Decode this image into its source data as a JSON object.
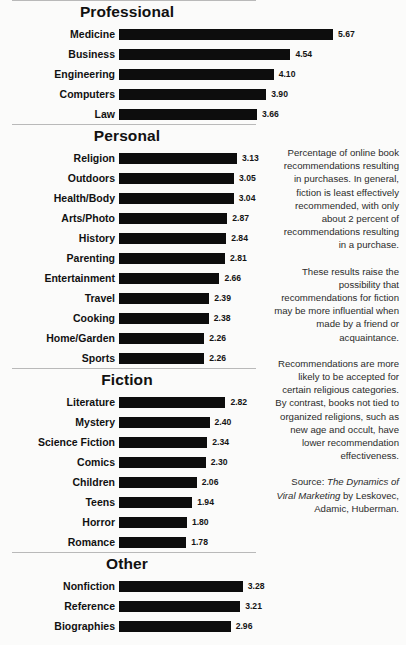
{
  "chart_data": {
    "type": "bar",
    "orientation": "horizontal",
    "title": "",
    "xlabel": "",
    "ylabel": "",
    "xlim": [
      0,
      5.67
    ],
    "grid": false,
    "legend": false,
    "value_format": "2 decimals",
    "sections": [
      {
        "title": "Professional",
        "categories": [
          "Medicine",
          "Business",
          "Engineering",
          "Computers",
          "Law"
        ],
        "values": [
          5.67,
          4.54,
          4.1,
          3.9,
          3.66
        ],
        "labels": [
          "5.67",
          "4.54",
          "4.10",
          "3.90",
          "3.66"
        ]
      },
      {
        "title": "Personal",
        "categories": [
          "Religion",
          "Outdoors",
          "Health/Body",
          "Arts/Photo",
          "History",
          "Parenting",
          "Entertainment",
          "Travel",
          "Cooking",
          "Home/Garden",
          "Sports"
        ],
        "values": [
          3.13,
          3.05,
          3.04,
          2.87,
          2.84,
          2.81,
          2.66,
          2.39,
          2.38,
          2.26,
          2.26
        ],
        "labels": [
          "3.13",
          "3.05",
          "3.04",
          "2.87",
          "2.84",
          "2.81",
          "2.66",
          "2.39",
          "2.38",
          "2.26",
          "2.26"
        ]
      },
      {
        "title": "Fiction",
        "categories": [
          "Literature",
          "Mystery",
          "Science Fiction",
          "Comics",
          "Children",
          "Teens",
          "Horror",
          "Romance"
        ],
        "values": [
          2.82,
          2.4,
          2.34,
          2.3,
          2.06,
          1.94,
          1.8,
          1.78
        ],
        "labels": [
          "2.82",
          "2.40",
          "2.34",
          "2.30",
          "2.06",
          "1.94",
          "1.80",
          "1.78"
        ]
      },
      {
        "title": "Other",
        "categories": [
          "Nonfiction",
          "Reference",
          "Biographies"
        ],
        "values": [
          3.28,
          3.21,
          2.96
        ],
        "labels": [
          "3.28",
          "3.21",
          "2.96"
        ]
      }
    ]
  },
  "caption": {
    "paragraphs": [
      "Percentage of online book recommendations resulting in purchases. In general, fiction is least effectively recommended, with only about 2 percent of recommendations resulting in a purchase.",
      "These results raise the possibility that recommendations for fiction may be more influential when made by a friend or acquaintance.",
      "Recommendations are more likely to be accepted for certain religious categories. By contrast, books not tied to organized religions, such as new age and occult, have lower recommendation effectiveness."
    ],
    "source_prefix": "Source: ",
    "source_title": "The Dynamics of Viral Marketing",
    "source_suffix": " by Leskovec, Adamic, Huberman."
  },
  "style": {
    "bar_color": "#0d0d0d",
    "text_color": "#141414",
    "rule_color": "#b9b9b9",
    "background": "#fbfbfa"
  }
}
